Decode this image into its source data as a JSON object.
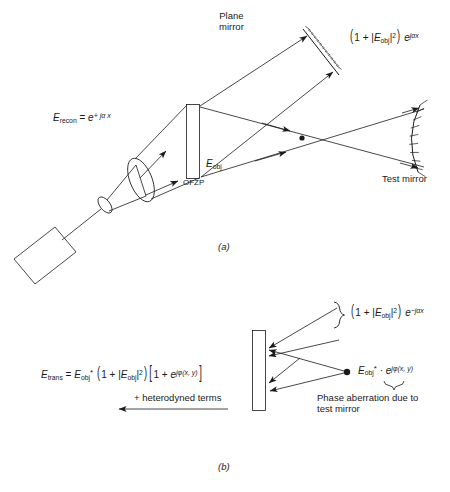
{
  "figure": {
    "title_a": "(a)",
    "title_b": "(b)",
    "panel_a": {
      "plane_mirror_label_line1": "Plane",
      "plane_mirror_label_line2": "mirror",
      "test_mirror_label": "Test mirror",
      "ofzp_label": "OFZP",
      "e_recon": {
        "symbol": "E",
        "subscript": "recon",
        "equals": "=",
        "exp_base": "e",
        "exp_power": "+ jα x"
      },
      "e_obj": {
        "symbol": "E",
        "subscript": "obj"
      },
      "reflected_field": {
        "open_paren": "(",
        "one_plus": "1 + |",
        "symbol": "E",
        "subscript": "obj",
        "mod_sq": "|",
        "sq_exp": "2",
        "close_paren": ")",
        "exp_base": "e",
        "exp_power": "jαx"
      }
    },
    "panel_b": {
      "incident_field": {
        "open_paren": "(",
        "one_plus": "1 + |",
        "symbol": "E",
        "subscript": "obj",
        "mod_sq": "|",
        "sq_exp": "2",
        "close_paren": ")",
        "exp_base": "e",
        "exp_power": "−jαx"
      },
      "point_field": {
        "symbol": "E",
        "subscript": "obj",
        "star": "*",
        "dot": "·",
        "exp_base": "e",
        "exp_power": "jφ(x, y)"
      },
      "phase_note_line1": "Phase aberration due to",
      "phase_note_line2": "test mirror",
      "heterodyne_label": "+ heterodyned terms",
      "e_trans": {
        "symbol": "E",
        "subscript": "trans",
        "equals": "=",
        "conj_symbol": "E",
        "conj_subscript": "obj",
        "conj_star": "*",
        "open_paren": "(",
        "one_plus": "1 + |",
        "mod_symbol": "E",
        "mod_subscript": "obj",
        "mod_bar": "|",
        "mod_exp": "2",
        "close_paren": ")",
        "open_bracket": "[",
        "bracket_one_plus": "1 +",
        "bracket_exp_base": "e",
        "bracket_exp_power": "jφ(x, y)",
        "close_bracket": "]"
      }
    },
    "colors": {
      "ink": "#1a1a1a",
      "background": "#ffffff"
    }
  }
}
